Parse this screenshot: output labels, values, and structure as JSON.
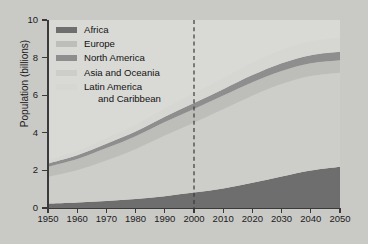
{
  "chart_data": {
    "type": "area",
    "stacked": true,
    "title": "",
    "xlabel": "",
    "ylabel": "Population (billions)",
    "xlim": [
      1950,
      2050
    ],
    "ylim": [
      0,
      10
    ],
    "grid": false,
    "legend_position": "top-left",
    "x": [
      1950,
      1960,
      1970,
      1980,
      1990,
      2000,
      2010,
      2020,
      2030,
      2040,
      2050
    ],
    "x_tick_labels": [
      "1950",
      "1960",
      "1970",
      "1980",
      "1990",
      "2000",
      "2010",
      "2020",
      "2030",
      "2040",
      "2050"
    ],
    "y_tick_labels": [
      "0",
      "2",
      "4",
      "6",
      "8",
      "10"
    ],
    "y_ticks": [
      0,
      2,
      4,
      6,
      8,
      10
    ],
    "annotations": [
      {
        "type": "vertical-dashed-line",
        "x": 2000,
        "label": ""
      }
    ],
    "series": [
      {
        "name": "Africa",
        "color": "#6e6e6e",
        "values": [
          0.23,
          0.29,
          0.37,
          0.48,
          0.63,
          0.82,
          1.04,
          1.34,
          1.68,
          2.0,
          2.2
        ]
      },
      {
        "name": "Asia and Oceania",
        "color": "#cdcdc9",
        "values": [
          1.42,
          1.72,
          2.16,
          2.65,
          3.22,
          3.72,
          4.21,
          4.63,
          4.91,
          5.02,
          5.0
        ]
      },
      {
        "name": "Europe",
        "color": "#bdbdb9",
        "values": [
          0.55,
          0.6,
          0.66,
          0.69,
          0.72,
          0.73,
          0.73,
          0.72,
          0.7,
          0.68,
          0.66
        ]
      },
      {
        "name": "North America",
        "color": "#8e8e8e",
        "values": [
          0.17,
          0.2,
          0.23,
          0.25,
          0.28,
          0.31,
          0.34,
          0.38,
          0.41,
          0.43,
          0.45
        ]
      },
      {
        "name": "Latin America and Caribbean",
        "color": "#d6d6d2",
        "values": [
          0.17,
          0.22,
          0.29,
          0.36,
          0.44,
          0.52,
          0.59,
          0.66,
          0.71,
          0.74,
          0.75
        ]
      }
    ],
    "legend": [
      {
        "label": "Africa",
        "color": "#6e6e6e"
      },
      {
        "label": "Europe",
        "color": "#bdbdb9"
      },
      {
        "label": "North America",
        "color": "#8e8e8e"
      },
      {
        "label": "Asia and Oceania",
        "color": "#cdcdc9"
      },
      {
        "label": "Latin America",
        "label2": "and Caribbean",
        "color": "#d6d6d2"
      }
    ],
    "colors": {
      "background": "#c9c9c6",
      "plot_background": "#d9d9d6",
      "axis": "#3a3a3a",
      "text": "#1b1b1b"
    }
  }
}
